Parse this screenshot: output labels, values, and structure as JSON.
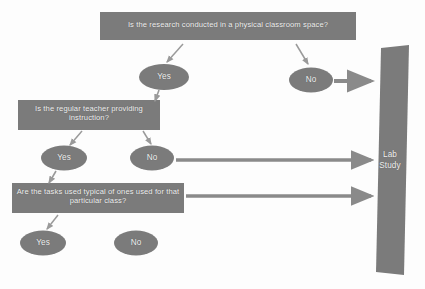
{
  "diagram": {
    "background_color": "#fdfdfd",
    "node_fill": "#7b7b7b",
    "node_text_color": "#f2f2f2",
    "arrow_color": "#8a8a8a",
    "thin_arrow_color": "#9a9a9a",
    "decisions": [
      {
        "id": "q1",
        "shape": "rectangle",
        "label": "Is the research conducted in a physical classroom space?"
      },
      {
        "id": "q2",
        "shape": "rectangle",
        "label": "Is the regular teacher providing instruction?"
      },
      {
        "id": "q3",
        "shape": "rectangle",
        "label": "Are the tasks used typical of ones used for that particular class?"
      }
    ],
    "answers": [
      {
        "id": "q1-yes",
        "shape": "ellipse",
        "label": "Yes"
      },
      {
        "id": "q1-no",
        "shape": "ellipse",
        "label": "No"
      },
      {
        "id": "q2-yes",
        "shape": "ellipse",
        "label": "Yes"
      },
      {
        "id": "q2-no",
        "shape": "ellipse",
        "label": "No"
      },
      {
        "id": "q3-yes",
        "shape": "ellipse",
        "label": "Yes"
      },
      {
        "id": "q3-no",
        "shape": "ellipse",
        "label": "No"
      }
    ],
    "terminal": {
      "id": "lab-study",
      "shape": "slanted-rectangle",
      "label_line1": "Lab",
      "label_line2": "Study"
    },
    "edges": [
      {
        "from": "q1",
        "to": "q1-yes",
        "style": "thin"
      },
      {
        "from": "q1",
        "to": "q1-no",
        "style": "thin"
      },
      {
        "from": "q1-yes",
        "to": "q2",
        "style": "thin"
      },
      {
        "from": "q1-no",
        "to": "lab-study",
        "style": "thick"
      },
      {
        "from": "q2",
        "to": "q2-yes",
        "style": "thin"
      },
      {
        "from": "q2",
        "to": "q2-no",
        "style": "thin"
      },
      {
        "from": "q2-yes",
        "to": "q3",
        "style": "thin"
      },
      {
        "from": "q2-no",
        "to": "lab-study",
        "style": "thick"
      },
      {
        "from": "q3",
        "to": "lab-study",
        "style": "thick"
      },
      {
        "from": "q3",
        "to": "q3-yes",
        "style": "thin"
      }
    ]
  }
}
